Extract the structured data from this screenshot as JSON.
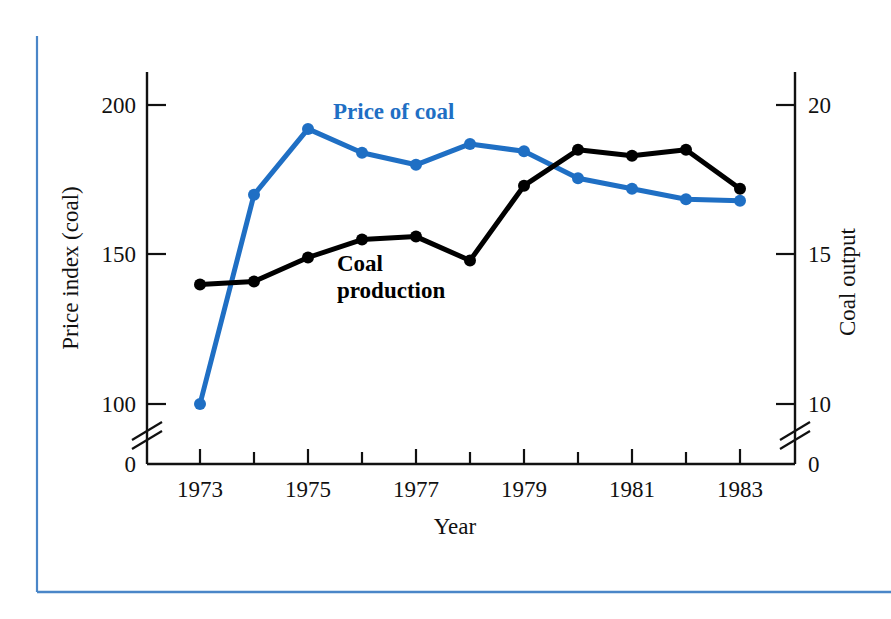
{
  "figure": {
    "frame_color": "#4a86c8",
    "background": "#ffffff"
  },
  "axes": {
    "left": {
      "title": "Price index (coal)",
      "ticks": [
        "200",
        "150",
        "100",
        "0"
      ],
      "has_break": true
    },
    "right": {
      "title": "Coal output",
      "ticks": [
        "20",
        "15",
        "10",
        "0"
      ],
      "has_break": true
    },
    "bottom": {
      "title": "Year",
      "ticks": [
        "1973",
        "1975",
        "1977",
        "1979",
        "1981",
        "1983"
      ]
    }
  },
  "labels": {
    "price_of_coal": "Price of coal",
    "coal_production_line1": "Coal",
    "coal_production_line2": "production"
  },
  "chart_data": {
    "type": "line",
    "title": "",
    "xlabel": "Year",
    "ylabel": "Price index (coal)",
    "y2label": "Coal output",
    "grid": false,
    "legend": "inline-annotations",
    "x": [
      1973,
      1974,
      1975,
      1976,
      1977,
      1978,
      1979,
      1980,
      1981,
      1982,
      1983
    ],
    "xlim": [
      1972.4,
      1983.6
    ],
    "ylim": [
      95,
      205
    ],
    "y2lim": [
      9.5,
      20.5
    ],
    "axis_break_left_between": [
      0,
      95
    ],
    "axis_break_right_between": [
      0,
      9.5
    ],
    "xticks": [
      1973,
      1975,
      1977,
      1979,
      1981,
      1983
    ],
    "xticks_minor": [
      1974,
      1976,
      1978,
      1980,
      1982
    ],
    "yticks": [
      100,
      150,
      200
    ],
    "y2ticks": [
      10,
      15,
      20
    ],
    "series": [
      {
        "name": "Price of coal",
        "axis": "left",
        "color": "#1f6fc4",
        "marker": "circle",
        "values": [
          100,
          170,
          192,
          184,
          180,
          187,
          184.5,
          175.5,
          172,
          168.5,
          168
        ]
      },
      {
        "name": "Coal production",
        "axis": "right",
        "color": "#000000",
        "marker": "circle",
        "values": [
          14.0,
          14.1,
          14.9,
          15.5,
          15.6,
          14.8,
          17.3,
          18.5,
          18.3,
          18.5,
          17.2
        ]
      }
    ]
  }
}
